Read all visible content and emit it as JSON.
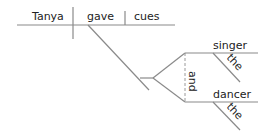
{
  "diagram": {
    "type": "sentence-diagram",
    "subject": "Tanya",
    "verb": "gave",
    "direct_object": "cues",
    "indirect_object": {
      "conjunction": "and",
      "items": [
        {
          "noun": "singer",
          "modifier": "the"
        },
        {
          "noun": "dancer",
          "modifier": "the"
        }
      ]
    },
    "line_color": "#8a8a8a",
    "text_color": "#222222"
  }
}
